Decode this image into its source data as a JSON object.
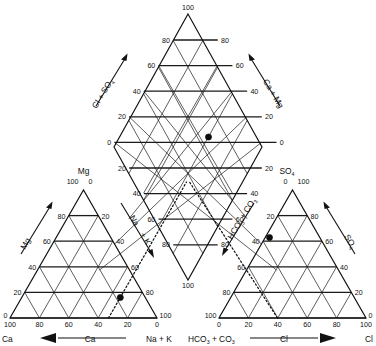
{
  "figure": {
    "type": "piper-trilinear-diagram",
    "title": "",
    "background_color": "#ffffff",
    "line_color": "#111111",
    "point_color": "#0d0d0d"
  },
  "chart_data": {
    "type": "scatter",
    "subtitle": "",
    "xlabel": "",
    "ylabel": "",
    "grid": true,
    "legend": "none",
    "panels": [
      {
        "id": "cation-triangle",
        "name": "Cation ternary plot",
        "position": "lower-left",
        "apex_label": "Mg",
        "left_label": "Ca",
        "right_label": "Na + K",
        "axis_titles": [
          "Mg",
          "Ca",
          "Na + K"
        ],
        "ticks": [
          0,
          20,
          40,
          60,
          80,
          100
        ],
        "point": {
          "Ca": 30,
          "Mg": 20,
          "NaK": 50
        }
      },
      {
        "id": "anion-triangle",
        "name": "Anion ternary plot",
        "position": "lower-right",
        "apex_label": "SO4",
        "left_label": "HCO3 + CO3",
        "right_label": "Cl",
        "axis_titles": [
          "SO4",
          "HCO3 + CO3",
          "Cl"
        ],
        "ticks": [
          0,
          20,
          40,
          60,
          80,
          100
        ],
        "point": {
          "HCO3CO3": 30,
          "SO4": 40,
          "Cl": 30
        }
      },
      {
        "id": "diamond",
        "name": "Central diamond plot",
        "position": "top-center",
        "left_axis_title": "Cl + SO4",
        "right_axis_title": "Ca + Mg",
        "ticks": [
          0,
          20,
          40,
          60,
          80,
          100
        ],
        "point": {
          "CaMg": 30,
          "ClSO4": 40
        }
      }
    ],
    "tick_values": [
      0,
      20,
      40,
      60,
      80,
      100
    ],
    "series": [
      {
        "name": "Sample 1",
        "marker": "filled-circle",
        "points": [
          {
            "panel": "cation-triangle",
            "Ca": 30,
            "Mg": 20,
            "NaK": 50
          },
          {
            "panel": "anion-triangle",
            "HCO3CO3": 30,
            "SO4": 40,
            "Cl": 30
          },
          {
            "panel": "diamond",
            "CaMg": 30,
            "ClSO4": 40
          }
        ]
      }
    ],
    "projection_lines": "dotted projection lines from each triangle point into the central diamond"
  },
  "labels": {
    "diamond": {
      "apex_top": "100",
      "apex_bottom": "100",
      "left_axis": "Cl + SO",
      "left_axis_sub": "4",
      "right_axis_a": "Ca + Mg",
      "ticks_upper_left": [
        "80",
        "60",
        "40",
        "20",
        "0"
      ],
      "ticks_upper_right": [
        "80",
        "60",
        "40",
        "20",
        "0"
      ],
      "ticks_lower_left": [
        "20",
        "40",
        "60",
        "80"
      ],
      "ticks_lower_right": [
        "20",
        "40",
        "60",
        "80"
      ]
    },
    "cation": {
      "apex": "Mg",
      "apex_tick_left": "100",
      "apex_tick_right": "0",
      "left_axis_title": "Mg",
      "bottom_axis_title": "Ca",
      "bottom_left_corner": "Ca",
      "bottom_right_corner": "Na + K",
      "right_axis_title_a": "Na",
      "right_axis_title_b": "+ K",
      "left_ticks": [
        "80",
        "60",
        "40",
        "20",
        "0"
      ],
      "right_ticks": [
        "20",
        "40",
        "60",
        "80",
        "100"
      ],
      "bottom_ticks": [
        "100",
        "80",
        "60",
        "40",
        "20",
        "0"
      ]
    },
    "anion": {
      "apex": "SO",
      "apex_sub": "4",
      "apex_tick_left": "0",
      "apex_tick_right": "100",
      "right_axis_title": "SO",
      "right_axis_title_sub": "4",
      "bottom_axis_title": "Cl",
      "bottom_left_corner": "HCO",
      "bottom_left_corner_sub1": "3",
      "bottom_left_corner_mid": " + CO",
      "bottom_left_corner_sub2": "3",
      "bottom_right_corner": "Cl",
      "left_axis_title": "HCO3 + CO3",
      "left_ticks": [
        "20",
        "40",
        "60",
        "80",
        "100"
      ],
      "right_ticks": [
        "80",
        "60",
        "40",
        "20",
        "0"
      ],
      "bottom_ticks": [
        "0",
        "20",
        "40",
        "60",
        "80",
        "100"
      ]
    }
  },
  "ticks": {
    "t0": "0",
    "t20": "20",
    "t40": "40",
    "t60": "60",
    "t80": "80",
    "t100": "100"
  }
}
